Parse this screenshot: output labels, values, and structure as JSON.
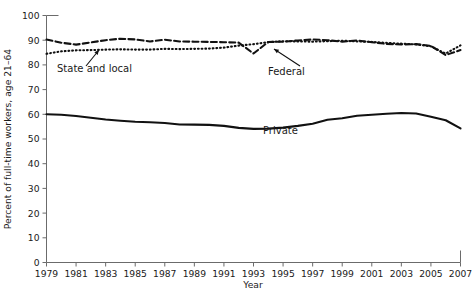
{
  "chart_data": {
    "type": "line",
    "title": "",
    "xlabel": "Year",
    "ylabel": "Percent of full-time workers, age 21–64",
    "xlim": [
      1979,
      2007
    ],
    "ylim": [
      0,
      100
    ],
    "ytick_step": 10,
    "xtick_step": 2,
    "grid": false,
    "legend_position": "inline-annotations",
    "yticks": [
      "0",
      "10",
      "20",
      "30",
      "40",
      "50",
      "60",
      "70",
      "80",
      "90",
      "100"
    ],
    "xticks": [
      "1979",
      "1981",
      "1983",
      "1985",
      "1987",
      "1989",
      "1991",
      "1993",
      "1995",
      "1997",
      "1999",
      "2001",
      "2003",
      "2005",
      "2007"
    ],
    "x": [
      1979,
      1980,
      1981,
      1982,
      1983,
      1984,
      1985,
      1986,
      1987,
      1988,
      1989,
      1990,
      1991,
      1992,
      1993,
      1994,
      1995,
      1996,
      1997,
      1998,
      1999,
      2000,
      2001,
      2002,
      2003,
      2004,
      2005,
      2006,
      2007
    ],
    "series": [
      {
        "name": "Federal",
        "style": "dashed",
        "values": [
          90.3,
          89.0,
          88.2,
          89.1,
          90.0,
          90.6,
          90.3,
          89.5,
          90.2,
          89.5,
          89.4,
          89.3,
          89.2,
          89.0,
          84.6,
          89.3,
          89.4,
          89.9,
          90.3,
          90.0,
          89.4,
          89.9,
          89.2,
          88.5,
          88.3,
          88.4,
          87.7,
          84.0,
          86.0
        ]
      },
      {
        "name": "State and local",
        "style": "dotted",
        "values": [
          84.5,
          85.5,
          85.9,
          86.0,
          86.2,
          86.3,
          86.2,
          86.2,
          86.5,
          86.4,
          86.5,
          86.6,
          87.0,
          87.8,
          88.4,
          89.2,
          89.6,
          89.5,
          89.4,
          89.6,
          89.8,
          89.5,
          89.3,
          88.9,
          88.6,
          88.3,
          87.5,
          84.6,
          87.9
        ]
      },
      {
        "name": "Private",
        "style": "solid",
        "values": [
          60.0,
          59.8,
          59.3,
          58.6,
          57.9,
          57.4,
          57.0,
          56.8,
          56.5,
          55.9,
          55.8,
          55.7,
          55.3,
          54.5,
          54.1,
          54.2,
          54.6,
          55.3,
          56.2,
          57.8,
          58.4,
          59.4,
          59.8,
          60.2,
          60.5,
          60.3,
          59.0,
          57.6,
          54.3
        ]
      }
    ],
    "annotations": [
      {
        "id": "state-and-local",
        "label": "State and local",
        "label_x": 57,
        "label_y": 72,
        "arrow_from_x": 86,
        "arrow_from_y": 66,
        "arrow_to_x": 99,
        "arrow_to_y": 50
      },
      {
        "id": "federal",
        "label": "Federal",
        "label_x": 268,
        "label_y": 75,
        "arrow_from_x": 300,
        "arrow_from_y": 66,
        "arrow_to_x": 274,
        "arrow_to_y": 49
      },
      {
        "id": "private",
        "label": "Private",
        "label_x": 263,
        "label_y": 134,
        "arrow_from_x": null,
        "arrow_from_y": null,
        "arrow_to_x": null,
        "arrow_to_y": null
      }
    ]
  },
  "colors": {
    "line": "#111111",
    "axis": "#6b6b6b",
    "text": "#1a1a1a",
    "background": "#ffffff"
  }
}
